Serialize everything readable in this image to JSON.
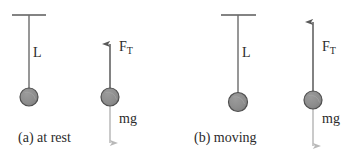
{
  "figure": {
    "width": 356,
    "height": 161,
    "background_color": "#ffffff",
    "ink_color": "#555555",
    "text_color": "#2b2b2b",
    "bob_fill_color": "#8c8c8c",
    "bob_stroke_color": "#4d4d4d",
    "tension_arrow_color": "#595959",
    "weight_arrow_color": "#b3b3b3"
  },
  "panels": [
    {
      "id": "panel-a",
      "caption": "(a) at rest",
      "pendulum": {
        "length_label": "L",
        "ceiling": {
          "x1": 12,
          "x2": 46,
          "y": 15
        },
        "string": {
          "x": 29,
          "y1": 15,
          "y2": 96
        },
        "bob": {
          "cx": 29,
          "cy": 97,
          "r": 9
        },
        "label_position": {
          "x": 33,
          "y": 46
        }
      },
      "free_body": {
        "bob": {
          "cx": 110,
          "cy": 97,
          "r": 9
        },
        "tension": {
          "label": "F",
          "label_subscript": "T",
          "direction": "up",
          "tail_y": 100,
          "head_y": 41,
          "x": 110,
          "label_position": {
            "x": 119,
            "y": 40
          }
        },
        "weight": {
          "label": "mg",
          "direction": "down",
          "tail_y": 96,
          "head_y": 147,
          "x": 110,
          "label_position": {
            "x": 119,
            "y": 112
          }
        }
      },
      "caption_position": {
        "x": 18,
        "y": 130
      }
    },
    {
      "id": "panel-b",
      "caption": "(b) moving",
      "pendulum": {
        "length_label": "L",
        "ceiling": {
          "x1": 221,
          "x2": 256,
          "y": 15
        },
        "string": {
          "x": 238,
          "y1": 15,
          "y2": 101
        },
        "bob": {
          "cx": 238,
          "cy": 102,
          "r": 9
        },
        "label_position": {
          "x": 242,
          "y": 46
        }
      },
      "free_body": {
        "bob": {
          "cx": 313,
          "cy": 100,
          "r": 9
        },
        "tension": {
          "label": "F",
          "label_subscript": "T",
          "direction": "up",
          "tail_y": 103,
          "head_y": 19,
          "x": 313,
          "label_position": {
            "x": 322,
            "y": 40
          }
        },
        "weight": {
          "label": "mg",
          "direction": "down",
          "tail_y": 99,
          "head_y": 150,
          "x": 313,
          "label_position": {
            "x": 322,
            "y": 112
          }
        }
      },
      "caption_position": {
        "x": 194,
        "y": 130
      }
    }
  ]
}
